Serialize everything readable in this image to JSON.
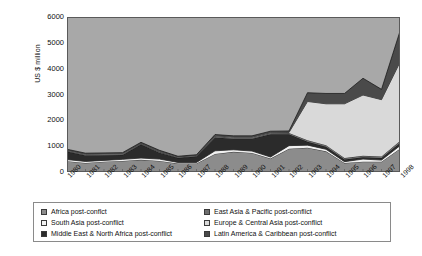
{
  "chart_data": {
    "type": "area",
    "title": "",
    "subtitle": "",
    "xlabel": "",
    "ylabel": "US $ million",
    "ylim": [
      0,
      6000
    ],
    "yticks": [
      0,
      1000,
      2000,
      3000,
      4000,
      5000,
      6000
    ],
    "grid": false,
    "stacked": true,
    "legend_position": "bottom",
    "x": [
      "1980",
      "1981",
      "1982",
      "1983",
      "1984",
      "1985",
      "1986",
      "1987",
      "1988",
      "1989",
      "1990",
      "1991",
      "1992",
      "1993",
      "1994",
      "1995",
      "1996",
      "1997",
      "1998"
    ],
    "series": [
      {
        "name": "Africa post-conflict",
        "color": "#8c8c8c",
        "values": [
          420,
          350,
          400,
          430,
          470,
          430,
          330,
          330,
          700,
          780,
          740,
          520,
          900,
          940,
          800,
          350,
          400,
          400,
          900
        ]
      },
      {
        "name": "South Asia post-conflict",
        "color": "#f2f2f2",
        "values": [
          60,
          60,
          50,
          60,
          70,
          70,
          40,
          40,
          120,
          80,
          70,
          60,
          120,
          100,
          80,
          50,
          100,
          60,
          120
        ]
      },
      {
        "name": "Middle East & North Africa post-conflict",
        "color": "#2b2b2b",
        "values": [
          310,
          230,
          200,
          170,
          520,
          250,
          170,
          230,
          520,
          430,
          480,
          880,
          440,
          130,
          100,
          80,
          70,
          80,
          100
        ]
      },
      {
        "name": "East Asia & Pacific post-conflict",
        "color": "#6e6e6e",
        "values": [
          30,
          30,
          30,
          30,
          30,
          30,
          20,
          20,
          40,
          40,
          40,
          40,
          50,
          60,
          60,
          60,
          60,
          60,
          80
        ]
      },
      {
        "name": "Europe & Central Asia post-conflict",
        "color": "#d9d9d9",
        "values": [
          20,
          20,
          20,
          20,
          20,
          20,
          20,
          20,
          20,
          20,
          20,
          20,
          20,
          1500,
          1600,
          2100,
          2350,
          2200,
          3050
        ]
      },
      {
        "name": "Latin America & Caribbean post-conflict",
        "color": "#4a4a4a",
        "values": [
          40,
          40,
          40,
          40,
          40,
          40,
          30,
          30,
          50,
          50,
          50,
          60,
          60,
          340,
          400,
          400,
          650,
          400,
          1200
        ]
      }
    ]
  },
  "axes": {
    "ytick_labels": [
      "6000",
      "5000",
      "4000",
      "3000",
      "2000",
      "1000",
      "0"
    ],
    "ylabel": "US $ million",
    "xtick_labels": [
      "1980",
      "1981",
      "1982",
      "1983",
      "1984",
      "1985",
      "1986",
      "1987",
      "1988",
      "1989",
      "1990",
      "1991",
      "1992",
      "1993",
      "1994",
      "1995",
      "1996",
      "1997",
      "1998"
    ]
  },
  "legend": {
    "items": [
      {
        "label": "Africa post-conflct",
        "color": "#8c8c8c"
      },
      {
        "label": "East Asia & Pacific post-conflict",
        "color": "#6e6e6e"
      },
      {
        "label": "South Asia post-conflict",
        "color": "#f2f2f2"
      },
      {
        "label": "Europe & Central Asia post-conflict",
        "color": "#d9d9d9"
      },
      {
        "label": "Middle East & North Africa post-conflict",
        "color": "#2b2b2b"
      },
      {
        "label": "Latin America & Caribbean post-conflict",
        "color": "#4a4a4a"
      }
    ]
  },
  "plot_style": {
    "background": "#a8a8a8",
    "frame": "#5a5a5a",
    "line": "#111111"
  }
}
